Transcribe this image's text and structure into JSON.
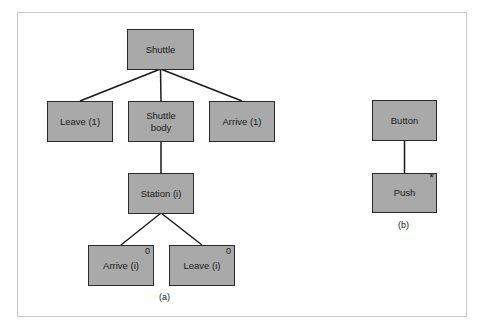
{
  "diagram": {
    "a": {
      "caption": "(a)",
      "nodes": [
        {
          "id": "shuttle",
          "label": "Shuttle",
          "mark": ""
        },
        {
          "id": "leave-1",
          "label": "Leave (1)",
          "mark": ""
        },
        {
          "id": "shuttle-body",
          "label": "Shuttle body",
          "mark": ""
        },
        {
          "id": "arrive-1",
          "label": "Arrive (1)",
          "mark": ""
        },
        {
          "id": "station-i",
          "label": "Station (i)",
          "mark": ""
        },
        {
          "id": "arrive-i",
          "label": "Arrive (i)",
          "mark": "0"
        },
        {
          "id": "leave-i",
          "label": "Leave (i)",
          "mark": "0"
        }
      ],
      "edges": [
        [
          "shuttle",
          "leave-1"
        ],
        [
          "shuttle",
          "shuttle-body"
        ],
        [
          "shuttle",
          "arrive-1"
        ],
        [
          "shuttle-body",
          "station-i"
        ],
        [
          "station-i",
          "arrive-i"
        ],
        [
          "station-i",
          "leave-i"
        ]
      ]
    },
    "b": {
      "caption": "(b)",
      "nodes": [
        {
          "id": "button",
          "label": "Button",
          "mark": ""
        },
        {
          "id": "push",
          "label": "Push",
          "mark": "*"
        }
      ],
      "edges": [
        [
          "button",
          "push"
        ]
      ]
    }
  }
}
